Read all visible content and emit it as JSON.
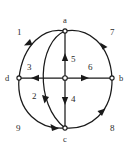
{
  "figure": {
    "type": "directed-graph-diagram",
    "background_color": "#ffffff",
    "stroke_color": "#1a1a1a",
    "text_color": "#2b2b2b",
    "width": 132,
    "height": 153
  },
  "vertices": [
    {
      "id": "a",
      "label": "a",
      "x": 65,
      "y": 31,
      "label_x": 63,
      "label_y": 16
    },
    {
      "id": "b",
      "label": "b",
      "x": 112,
      "y": 78,
      "label_x": 119,
      "label_y": 74
    },
    {
      "id": "c",
      "label": "c",
      "x": 65,
      "y": 128,
      "label_x": 63,
      "label_y": 135
    },
    {
      "id": "d",
      "label": "d",
      "x": 19,
      "y": 78,
      "label_x": 5,
      "label_y": 74
    },
    {
      "id": "center",
      "label": "",
      "x": 65,
      "y": 78,
      "label_x": 65,
      "label_y": 78
    }
  ],
  "edges": [
    {
      "id": "e1",
      "label": "1",
      "from": "a",
      "to": "d",
      "shape": "outer-left-arc",
      "label_x": 17,
      "label_y": 28
    },
    {
      "id": "e2",
      "label": "2",
      "from": "c",
      "to": "a",
      "shape": "inner-left-arc",
      "label_x": 32,
      "label_y": 92
    },
    {
      "id": "e3",
      "label": "3",
      "from": "center",
      "to": "d",
      "shape": "horizontal-left",
      "label_x": 27,
      "label_y": 63
    },
    {
      "id": "e4",
      "label": "4",
      "from": "a",
      "to": "c",
      "shape": "vertical-down",
      "label_x": 71,
      "label_y": 95
    },
    {
      "id": "e5",
      "label": "5",
      "from": "c",
      "to": "a",
      "shape": "vertical-up",
      "label_x": 71,
      "label_y": 55
    },
    {
      "id": "e6",
      "label": "6",
      "from": "center",
      "to": "b",
      "shape": "horizontal-right",
      "label_x": 88,
      "label_y": 63
    },
    {
      "id": "e7",
      "label": "7",
      "from": "b",
      "to": "a",
      "shape": "outer-right-arc",
      "label_x": 110,
      "label_y": 28
    },
    {
      "id": "e8",
      "label": "8",
      "from": "c",
      "to": "b",
      "shape": "outer-bottom-right-arc",
      "label_x": 110,
      "label_y": 124
    },
    {
      "id": "e9",
      "label": "9",
      "from": "d",
      "to": "c",
      "shape": "outer-bottom-left-arc",
      "label_x": 16,
      "label_y": 124
    }
  ]
}
